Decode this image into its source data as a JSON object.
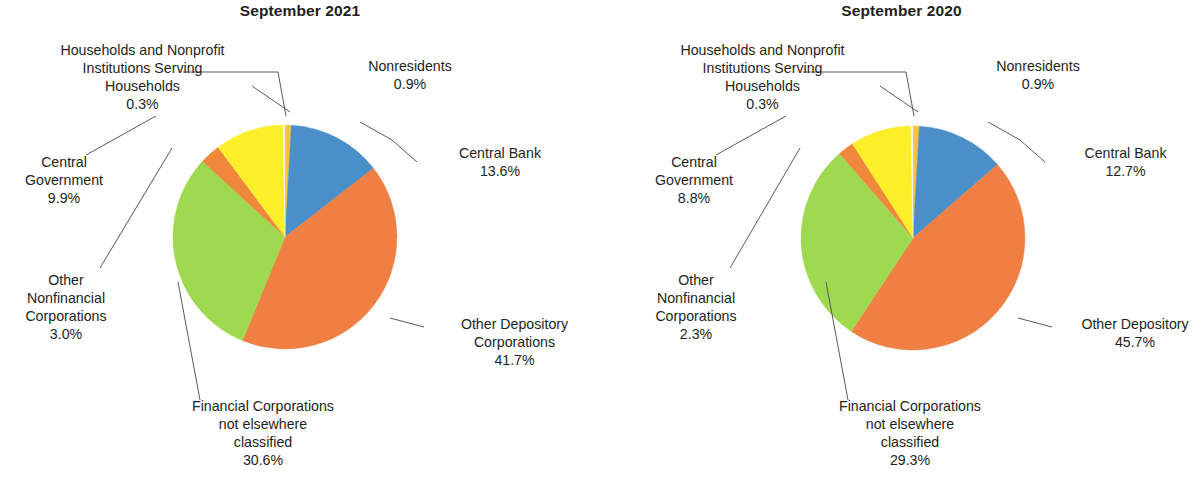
{
  "figure": {
    "background": "#ffffff",
    "text_color": "#231f20",
    "leader_line_color": "#58595b"
  },
  "palette": {
    "central_bank": "#4a8fc8",
    "other_depository": "#ef7f43",
    "financial_corporations_nec": "#9ed94f",
    "other_nonfinancial": "#f0883c",
    "central_government": "#fdee2a",
    "households_nonprofit": "#f3f4e7",
    "nonresidents": "#f5c23a"
  },
  "charts": [
    {
      "id": "september-2021",
      "title": "September 2021",
      "center_x": 285,
      "center_y": 237,
      "radius": 112,
      "slices": [
        {
          "key": "nonresidents",
          "label": "Nonresidents",
          "value": 0.9,
          "pct_text": "0.9%",
          "color": "#f5c23a"
        },
        {
          "key": "central_bank",
          "label": "Central Bank",
          "value": 13.6,
          "pct_text": "13.6%",
          "color": "#4a8fc8"
        },
        {
          "key": "other_depository",
          "label": "Other Depository\nCorporations",
          "value": 41.7,
          "pct_text": "41.7%",
          "color": "#ef7f43"
        },
        {
          "key": "financial_corporations_nec",
          "label": "Financial Corporations\nnot elsewhere\nclassified",
          "value": 30.6,
          "pct_text": "30.6%",
          "color": "#9ed94f"
        },
        {
          "key": "other_nonfinancial",
          "label": "Other\nNonfinancial\nCorporations",
          "value": 3.0,
          "pct_text": "3.0%",
          "color": "#f0883c"
        },
        {
          "key": "central_government",
          "label": "Central\nGovernment",
          "value": 9.9,
          "pct_text": "9.9%",
          "color": "#fdee2a"
        },
        {
          "key": "households_nonprofit",
          "label": "Households and Nonprofit\nInstitutions Serving\nHouseholds",
          "value": 0.3,
          "pct_text": "0.3%",
          "color": "#f3f4e7"
        }
      ]
    },
    {
      "id": "september-2020",
      "title": "September 2020",
      "center_x": 313,
      "center_y": 238,
      "radius": 112,
      "slices": [
        {
          "key": "nonresidents",
          "label": "Nonresidents",
          "value": 0.9,
          "pct_text": "0.9%",
          "color": "#f5c23a"
        },
        {
          "key": "central_bank",
          "label": "Central Bank",
          "value": 12.7,
          "pct_text": "12.7%",
          "color": "#4a8fc8"
        },
        {
          "key": "other_depository",
          "label": "Other Depository",
          "value": 45.7,
          "pct_text": "45.7%",
          "color": "#ef7f43"
        },
        {
          "key": "financial_corporations_nec",
          "label": "Financial Corporations\nnot elsewhere\nclassified",
          "value": 29.3,
          "pct_text": "29.3%",
          "color": "#9ed94f"
        },
        {
          "key": "other_nonfinancial",
          "label": "Other\nNonfinancial\nCorporations",
          "value": 2.3,
          "pct_text": "2.3%",
          "color": "#f0883c"
        },
        {
          "key": "central_government",
          "label": "Central\nGovernment",
          "value": 8.8,
          "pct_text": "8.8%",
          "color": "#fdee2a"
        },
        {
          "key": "households_nonprofit",
          "label": "Households and Nonprofit\nInstitutions Serving\nHouseholds",
          "value": 0.3,
          "pct_text": "0.3%",
          "color": "#f3f4e7"
        }
      ]
    }
  ],
  "chart_data": {
    "type": "pie",
    "panels": [
      {
        "title": "September 2021",
        "categories": [
          "Nonresidents",
          "Central Bank",
          "Other Depository Corporations",
          "Financial Corporations not elsewhere classified",
          "Other Nonfinancial Corporations",
          "Central Government",
          "Households and Nonprofit Institutions Serving Households"
        ],
        "values": [
          0.9,
          13.6,
          41.7,
          30.6,
          3.0,
          9.9,
          0.3
        ],
        "units": "percent",
        "total": 100.0
      },
      {
        "title": "September 2020",
        "categories": [
          "Nonresidents",
          "Central Bank",
          "Other Depository Corporations",
          "Financial Corporations not elsewhere classified",
          "Other Nonfinancial Corporations",
          "Central Government",
          "Households and Nonprofit Institutions Serving Households"
        ],
        "values": [
          0.9,
          12.7,
          45.7,
          29.3,
          2.3,
          8.8,
          0.3
        ],
        "units": "percent",
        "total": 100.0
      }
    ],
    "legend": "none (direct labels with leader lines)",
    "grid": false
  },
  "labels": {
    "left": [
      {
        "name": "households-nonprofit",
        "text": "Households and Nonprofit\nInstitutions Serving\nHouseholds\n0.3%",
        "x": 10,
        "y": 42,
        "w": 265,
        "align": "center"
      },
      {
        "name": "nonresidents",
        "text": "Nonresidents\n0.9%",
        "x": 335,
        "y": 58,
        "w": 150,
        "align": "center"
      },
      {
        "name": "central-bank",
        "text": "Central Bank\n13.6%",
        "x": 420,
        "y": 145,
        "w": 160,
        "align": "center"
      },
      {
        "name": "central-government",
        "text": "Central\nGovernment\n9.9%",
        "x": 5,
        "y": 154,
        "w": 118,
        "align": "center"
      },
      {
        "name": "other-nonfinancial",
        "text": "Other\nNonfinancial\nCorporations\n3.0%",
        "x": 5,
        "y": 272,
        "w": 122,
        "align": "center"
      },
      {
        "name": "other-depository",
        "text": "Other Depository\nCorporations\n41.7%",
        "x": 432,
        "y": 316,
        "w": 165,
        "align": "center"
      },
      {
        "name": "financial-corps-nec",
        "text": "Financial Corporations\nnot elsewhere\nclassified\n30.6%",
        "x": 165,
        "y": 398,
        "w": 196,
        "align": "center"
      }
    ],
    "right": [
      {
        "name": "households-nonprofit",
        "text": "Households and Nonprofit\nInstitutions Serving\nHouseholds\n0.3%",
        "x": 30,
        "y": 42,
        "w": 265,
        "align": "center"
      },
      {
        "name": "nonresidents",
        "text": "Nonresidents\n0.9%",
        "x": 363,
        "y": 58,
        "w": 150,
        "align": "center"
      },
      {
        "name": "central-bank",
        "text": "Central Bank\n12.7%",
        "x": 448,
        "y": 145,
        "w": 155,
        "align": "center"
      },
      {
        "name": "central-government",
        "text": "Central\nGovernment\n8.8%",
        "x": 35,
        "y": 154,
        "w": 118,
        "align": "center"
      },
      {
        "name": "other-nonfinancial",
        "text": "Other\nNonfinancial\nCorporations\n2.3%",
        "x": 35,
        "y": 272,
        "w": 122,
        "align": "center"
      },
      {
        "name": "other-depository",
        "text": "Other Depository\n45.7%",
        "x": 460,
        "y": 316,
        "w": 150,
        "align": "center"
      },
      {
        "name": "financial-corps-nec",
        "text": "Financial Corporations\nnot elsewhere\nclassified\n29.3%",
        "x": 212,
        "y": 398,
        "w": 196,
        "align": "center"
      }
    ]
  },
  "leaders": {
    "left": [
      {
        "name": "households-nonprofit-leader",
        "points": "183,72 278,72 286,116"
      },
      {
        "name": "nonresidents-leader",
        "points": "252,86 290,112"
      },
      {
        "name": "central-bank-leader",
        "points": "417,162 392,140 360,122"
      },
      {
        "name": "central-government-leader",
        "points": "86,155 156,116"
      },
      {
        "name": "other-nonfinancial-leader",
        "points": "100,268 172,148"
      },
      {
        "name": "other-depository-leader",
        "points": "424,327 390,318"
      },
      {
        "name": "financial-corps-nec-leader",
        "points": "200,400 178,282"
      }
    ],
    "right": [
      {
        "name": "households-nonprofit-leader",
        "points": "203,72 306,72 314,116"
      },
      {
        "name": "nonresidents-leader",
        "points": "280,86 318,112"
      },
      {
        "name": "central-bank-leader",
        "points": "445,162 420,140 388,122"
      },
      {
        "name": "central-government-leader",
        "points": "116,155 186,116"
      },
      {
        "name": "other-nonfinancial-leader",
        "points": "130,268 200,148"
      },
      {
        "name": "other-depository-leader",
        "points": "452,327 418,318"
      },
      {
        "name": "financial-corps-nec-leader",
        "points": "248,400 226,282"
      }
    ]
  }
}
